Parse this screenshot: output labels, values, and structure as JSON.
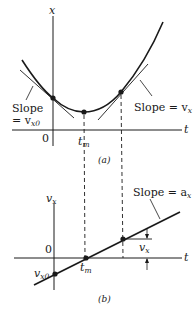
{
  "figure": {
    "panel_a": {
      "caption": "(a)",
      "y_axis_label": "x",
      "x_axis_label": "t",
      "origin_label": "0",
      "tm_label": "t",
      "tm_sub": "m",
      "left_slope": {
        "line1": "Slope",
        "line2": "= v",
        "sub": "x0"
      },
      "right_slope": {
        "text": "Slope = v",
        "sub": "x"
      }
    },
    "panel_b": {
      "caption": "(b)",
      "y_axis_label": "v",
      "y_axis_sub": "x",
      "x_axis_label": "t",
      "origin_label": "0",
      "tm_label": "t",
      "tm_sub": "m",
      "intercept_label": "v",
      "intercept_sub": "x0",
      "slope_label": {
        "text": "Slope = a",
        "sub": "x"
      },
      "vx_marker": {
        "text": "v",
        "sub": "x"
      }
    },
    "colors": {
      "ink": "#1a1a1a",
      "background": "#ffffff"
    }
  }
}
